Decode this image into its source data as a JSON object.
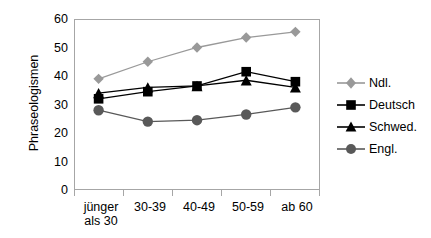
{
  "chart_data": {
    "type": "line",
    "title": "",
    "xlabel": "",
    "ylabel": "Phraseologismen",
    "categories": [
      "jünger\nals 30",
      "30-39",
      "40-49",
      "50-59",
      "ab 60"
    ],
    "ylim": [
      0,
      60
    ],
    "yticks": [
      0,
      10,
      20,
      30,
      40,
      50,
      60
    ],
    "grid": false,
    "legend_position": "right",
    "series": [
      {
        "name": "Ndl.",
        "values": [
          39,
          45,
          50,
          53.5,
          55.5
        ],
        "color": "#999999",
        "marker": "diamond"
      },
      {
        "name": "Deutsch",
        "values": [
          32,
          34.5,
          36.5,
          41.5,
          38
        ],
        "color": "#000000",
        "marker": "square"
      },
      {
        "name": "Schwed.",
        "values": [
          34,
          36,
          36.5,
          38.5,
          36
        ],
        "color": "#000000",
        "marker": "triangle"
      },
      {
        "name": "Engl.",
        "values": [
          28,
          24,
          24.5,
          26.5,
          29
        ],
        "color": "#595959",
        "marker": "circle"
      }
    ]
  },
  "axis": {
    "y_tick_labels": [
      "60",
      "50",
      "40",
      "30",
      "20",
      "10",
      "0"
    ],
    "y_title": "Phraseologismen",
    "x_tick_labels": [
      "jünger\nals 30",
      "30-39",
      "40-49",
      "50-59",
      "ab 60"
    ]
  },
  "legend": {
    "items": [
      {
        "label": "Ndl."
      },
      {
        "label": "Deutsch"
      },
      {
        "label": "Schwed."
      },
      {
        "label": "Engl."
      }
    ]
  }
}
